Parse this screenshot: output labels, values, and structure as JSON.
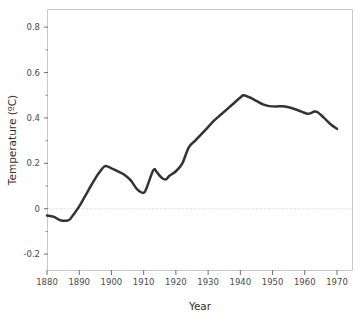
{
  "chart_data": {
    "type": "line",
    "title": "",
    "subtitle": "",
    "xlabel": "Year",
    "ylabel": "Temperature (ºC)",
    "xlim": [
      1880,
      1970
    ],
    "ylim": [
      -0.27,
      0.88
    ],
    "xticks": [
      1880,
      1890,
      1900,
      1910,
      1920,
      1930,
      1940,
      1950,
      1960,
      1970
    ],
    "xtick_labels": [
      "1880",
      "1890",
      "1900",
      "1910",
      "1920",
      "1930",
      "1940",
      "1950",
      "1960",
      "1970"
    ],
    "yticks": [
      -0.2,
      0,
      0.2,
      0.4,
      0.6,
      0.8
    ],
    "ytick_labels": [
      "-0.2",
      "0",
      "0.2",
      "0.4",
      "0.6",
      "0.8"
    ],
    "yminor_ticks": [
      -0.1,
      0.1,
      0.3,
      0.5,
      0.7
    ],
    "grid": false,
    "zero_reference_line": true,
    "legend": null,
    "line_color": "#333333",
    "line_width": 2.5,
    "x": [
      1880,
      1882,
      1884,
      1885,
      1886,
      1887,
      1888,
      1890,
      1892,
      1894,
      1896,
      1898,
      1900,
      1902,
      1904,
      1906,
      1908,
      1910,
      1911,
      1913,
      1914,
      1915,
      1916,
      1917,
      1918,
      1920,
      1922,
      1924,
      1926,
      1928,
      1930,
      1932,
      1934,
      1936,
      1938,
      1940,
      1941,
      1943,
      1945,
      1947,
      1949,
      1951,
      1953,
      1955,
      1957,
      1959,
      1961,
      1963,
      1964,
      1966,
      1968,
      1970
    ],
    "y": [
      -0.03,
      -0.035,
      -0.05,
      -0.053,
      -0.053,
      -0.048,
      -0.03,
      0.01,
      0.06,
      0.11,
      0.155,
      0.188,
      0.178,
      0.165,
      0.15,
      0.125,
      0.085,
      0.07,
      0.095,
      0.17,
      0.163,
      0.145,
      0.132,
      0.13,
      0.145,
      0.165,
      0.2,
      0.27,
      0.3,
      0.33,
      0.36,
      0.39,
      0.415,
      0.44,
      0.465,
      0.49,
      0.5,
      0.49,
      0.475,
      0.46,
      0.452,
      0.45,
      0.452,
      0.447,
      0.438,
      0.428,
      0.418,
      0.428,
      0.425,
      0.4,
      0.372,
      0.352
    ]
  }
}
